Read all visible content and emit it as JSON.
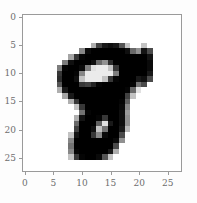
{
  "figure": {
    "name": "mnist-digit-imshow",
    "background_color": "#fdfdfd",
    "axes_face_color": "#ffffff",
    "spine_color": "#9a9a9a",
    "tick_label_color": "#6d6d6d"
  },
  "chart_data": {
    "type": "heatmap",
    "title": "",
    "xlabel": "",
    "ylabel": "",
    "colormap": "gray_r",
    "grid": false,
    "legend": null,
    "xlim": [
      -0.5,
      27.5
    ],
    "ylim": [
      27.5,
      -0.5
    ],
    "x_ticks": [
      0,
      5,
      10,
      15,
      20,
      25
    ],
    "y_ticks": [
      0,
      5,
      10,
      15,
      20,
      25
    ],
    "x_tick_labels": [
      "0",
      "5",
      "10",
      "15",
      "20",
      "25"
    ],
    "y_tick_labels": [
      "0",
      "5",
      "10",
      "15",
      "20",
      "25"
    ],
    "rows": 28,
    "cols": 28,
    "value_range": [
      0,
      255
    ],
    "values": [
      [
        0,
        0,
        0,
        0,
        0,
        0,
        0,
        0,
        0,
        0,
        0,
        0,
        0,
        0,
        0,
        0,
        0,
        0,
        0,
        0,
        0,
        0,
        0,
        0,
        0,
        0,
        0,
        0
      ],
      [
        0,
        0,
        0,
        0,
        0,
        0,
        0,
        0,
        0,
        0,
        0,
        0,
        0,
        0,
        0,
        0,
        0,
        0,
        0,
        0,
        0,
        0,
        0,
        0,
        0,
        0,
        0,
        0
      ],
      [
        0,
        0,
        0,
        0,
        0,
        0,
        0,
        0,
        0,
        0,
        0,
        0,
        0,
        0,
        0,
        0,
        0,
        0,
        0,
        0,
        0,
        0,
        0,
        0,
        0,
        0,
        0,
        0
      ],
      [
        0,
        0,
        0,
        0,
        0,
        0,
        0,
        0,
        0,
        0,
        0,
        0,
        0,
        0,
        0,
        0,
        0,
        0,
        0,
        0,
        0,
        0,
        0,
        0,
        0,
        0,
        0,
        0
      ],
      [
        0,
        0,
        0,
        0,
        0,
        0,
        0,
        0,
        0,
        0,
        0,
        0,
        0,
        0,
        0,
        0,
        0,
        0,
        0,
        0,
        0,
        0,
        0,
        0,
        0,
        0,
        0,
        0
      ],
      [
        0,
        0,
        0,
        0,
        0,
        0,
        0,
        0,
        0,
        0,
        0,
        0,
        80,
        190,
        230,
        240,
        230,
        170,
        60,
        0,
        0,
        60,
        0,
        0,
        0,
        0,
        0,
        0
      ],
      [
        0,
        0,
        0,
        0,
        0,
        0,
        0,
        0,
        0,
        0,
        120,
        245,
        255,
        255,
        255,
        255,
        255,
        255,
        240,
        150,
        110,
        235,
        180,
        0,
        0,
        0,
        0,
        0
      ],
      [
        0,
        0,
        0,
        0,
        0,
        0,
        0,
        0,
        90,
        200,
        250,
        255,
        255,
        255,
        255,
        255,
        255,
        255,
        255,
        255,
        255,
        255,
        235,
        0,
        0,
        0,
        0,
        0
      ],
      [
        0,
        0,
        0,
        0,
        0,
        0,
        0,
        130,
        240,
        255,
        255,
        255,
        240,
        150,
        110,
        210,
        255,
        255,
        255,
        255,
        255,
        255,
        245,
        0,
        0,
        0,
        0,
        0
      ],
      [
        0,
        0,
        0,
        0,
        0,
        0,
        130,
        250,
        255,
        255,
        245,
        130,
        30,
        20,
        20,
        60,
        200,
        255,
        255,
        255,
        255,
        255,
        245,
        0,
        0,
        0,
        0,
        0
      ],
      [
        0,
        0,
        0,
        0,
        0,
        0,
        200,
        255,
        255,
        250,
        120,
        20,
        20,
        20,
        20,
        20,
        130,
        255,
        255,
        255,
        255,
        255,
        230,
        0,
        0,
        0,
        0,
        0
      ],
      [
        0,
        0,
        0,
        0,
        0,
        0,
        210,
        255,
        255,
        240,
        60,
        20,
        20,
        20,
        60,
        200,
        250,
        255,
        255,
        255,
        230,
        240,
        180,
        0,
        0,
        0,
        0,
        0
      ],
      [
        0,
        0,
        0,
        0,
        0,
        0,
        170,
        255,
        255,
        255,
        200,
        190,
        220,
        250,
        255,
        255,
        255,
        255,
        255,
        250,
        140,
        180,
        0,
        0,
        0,
        0,
        0,
        0
      ],
      [
        0,
        0,
        0,
        0,
        0,
        0,
        80,
        230,
        255,
        255,
        255,
        255,
        255,
        255,
        255,
        255,
        255,
        255,
        250,
        150,
        30,
        0,
        0,
        0,
        0,
        0,
        0,
        0
      ],
      [
        0,
        0,
        0,
        0,
        0,
        0,
        0,
        90,
        230,
        255,
        255,
        255,
        255,
        255,
        255,
        255,
        255,
        255,
        190,
        60,
        0,
        0,
        0,
        0,
        0,
        0,
        0,
        0
      ],
      [
        0,
        0,
        0,
        0,
        0,
        0,
        0,
        0,
        80,
        200,
        255,
        255,
        255,
        255,
        255,
        255,
        255,
        250,
        160,
        0,
        0,
        0,
        0,
        0,
        0,
        0,
        0,
        0
      ],
      [
        0,
        0,
        0,
        0,
        0,
        0,
        0,
        0,
        0,
        60,
        200,
        255,
        255,
        255,
        255,
        255,
        255,
        245,
        120,
        0,
        0,
        0,
        0,
        0,
        0,
        0,
        0,
        0
      ],
      [
        0,
        0,
        0,
        0,
        0,
        0,
        0,
        0,
        0,
        0,
        140,
        250,
        255,
        255,
        255,
        255,
        255,
        240,
        100,
        0,
        0,
        0,
        0,
        0,
        0,
        0,
        0,
        0
      ],
      [
        0,
        0,
        0,
        0,
        0,
        0,
        0,
        0,
        0,
        80,
        235,
        255,
        255,
        250,
        200,
        255,
        255,
        240,
        110,
        0,
        0,
        0,
        0,
        0,
        0,
        0,
        0,
        0
      ],
      [
        0,
        0,
        0,
        0,
        0,
        0,
        0,
        0,
        0,
        150,
        255,
        255,
        255,
        160,
        30,
        230,
        255,
        240,
        110,
        0,
        0,
        0,
        0,
        0,
        0,
        0,
        0,
        0
      ],
      [
        0,
        0,
        0,
        0,
        0,
        0,
        0,
        0,
        0,
        190,
        255,
        255,
        240,
        60,
        140,
        255,
        255,
        230,
        70,
        0,
        0,
        0,
        0,
        0,
        0,
        0,
        0,
        0
      ],
      [
        0,
        0,
        0,
        0,
        0,
        0,
        0,
        0,
        60,
        235,
        255,
        255,
        200,
        120,
        245,
        255,
        255,
        180,
        0,
        0,
        0,
        0,
        0,
        0,
        0,
        0,
        0,
        0
      ],
      [
        0,
        0,
        0,
        0,
        0,
        0,
        0,
        0,
        120,
        255,
        255,
        255,
        255,
        255,
        255,
        255,
        245,
        110,
        0,
        0,
        0,
        0,
        0,
        0,
        0,
        0,
        0,
        0
      ],
      [
        0,
        0,
        0,
        0,
        0,
        0,
        0,
        0,
        140,
        255,
        255,
        255,
        255,
        255,
        255,
        255,
        180,
        0,
        0,
        0,
        0,
        0,
        0,
        0,
        0,
        0,
        0,
        0
      ],
      [
        0,
        0,
        0,
        0,
        0,
        0,
        0,
        0,
        120,
        250,
        255,
        255,
        255,
        255,
        255,
        230,
        80,
        0,
        0,
        0,
        0,
        0,
        0,
        0,
        0,
        0,
        0,
        0
      ],
      [
        0,
        0,
        0,
        0,
        0,
        0,
        0,
        0,
        60,
        200,
        250,
        255,
        255,
        245,
        170,
        60,
        0,
        0,
        0,
        0,
        0,
        0,
        0,
        0,
        0,
        0,
        0,
        0
      ],
      [
        0,
        0,
        0,
        0,
        0,
        0,
        0,
        0,
        0,
        0,
        0,
        0,
        0,
        0,
        0,
        0,
        0,
        0,
        0,
        0,
        0,
        0,
        0,
        0,
        0,
        0,
        0,
        0
      ],
      [
        0,
        0,
        0,
        0,
        0,
        0,
        0,
        0,
        0,
        0,
        0,
        0,
        0,
        0,
        0,
        0,
        0,
        0,
        0,
        0,
        0,
        0,
        0,
        0,
        0,
        0,
        0,
        0
      ]
    ]
  }
}
